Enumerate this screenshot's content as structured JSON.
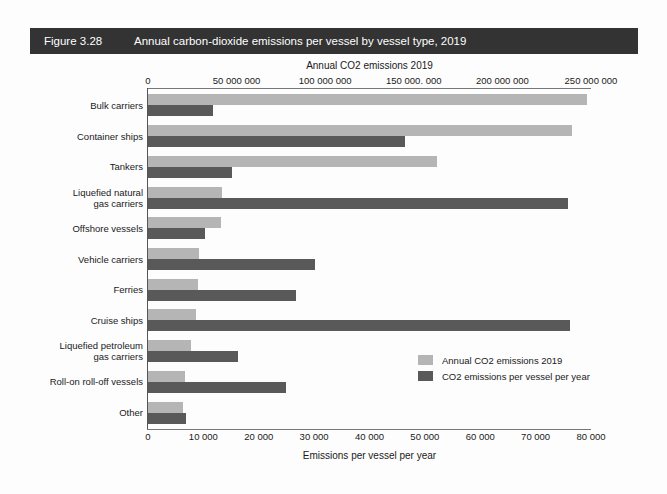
{
  "figure": {
    "number": "Figure 3.28",
    "title": "Annual carbon-dioxide emissions per vessel by vessel type, 2019"
  },
  "axes": {
    "top": {
      "title": "Annual CO2 emissions 2019",
      "ticks": [
        "0",
        "50 000 000",
        "100 000 000",
        "150 000. 000",
        "200 000 000",
        "250 000 000"
      ],
      "tick_values": [
        0,
        50000000,
        100000000,
        150000000,
        200000000,
        250000000
      ],
      "max": 250000000
    },
    "bottom": {
      "title": "Emissions per vessel per year",
      "ticks": [
        "0",
        "10 000",
        "20 000",
        "30 000",
        "40 000",
        "50 000",
        "60 000",
        "70 000",
        "80 000"
      ],
      "tick_values": [
        0,
        10000,
        20000,
        30000,
        40000,
        50000,
        60000,
        70000,
        80000
      ],
      "max": 80000
    }
  },
  "legend": {
    "position": "inside-right",
    "items": [
      {
        "label": "Annual CO2 emissions 2019",
        "color": "#b5b5b5"
      },
      {
        "label": "CO2 emissions per vessel per year",
        "color": "#595959"
      }
    ]
  },
  "colors": {
    "light_bar": "#b5b5b5",
    "dark_bar": "#595959",
    "banner": "#333333",
    "banner_text": "#ffffff",
    "text": "#1a1a1a",
    "background": "#fdfdfd"
  },
  "chart_data": {
    "type": "bar",
    "orientation": "horizontal",
    "title": "Annual carbon-dioxide emissions per vessel by vessel type, 2019",
    "xlabel": "Emissions per vessel per year",
    "xlabel_secondary": "Annual CO2 emissions 2019",
    "ylabel": "",
    "grid": false,
    "xlim": [
      0,
      80000
    ],
    "xlim_secondary": [
      0,
      250000000
    ],
    "categories": [
      "Bulk carriers",
      "Container ships",
      "Tankers",
      "Liquefied natural gas carriers",
      "Offshore vessels",
      "Vehicle carriers",
      "Ferries",
      "Cruise ships",
      "Liquefied petroleum gas carriers",
      "Roll-on roll-off vessels",
      "Other"
    ],
    "category_display": [
      [
        "Bulk carriers"
      ],
      [
        "Container ships"
      ],
      [
        "Tankers"
      ],
      [
        "Liquefied natural",
        "gas carriers"
      ],
      [
        "Offshore vessels"
      ],
      [
        "Vehicle carriers"
      ],
      [
        "Ferries"
      ],
      [
        "Cruise ships"
      ],
      [
        "Liquefied petroleum",
        "gas carriers"
      ],
      [
        "Roll-on roll-off vessels"
      ],
      [
        "Other"
      ]
    ],
    "series": [
      {
        "name": "Annual CO2 emissions 2019",
        "color": "#b5b5b5",
        "axis": "top",
        "units": "tonnes CO2",
        "values": [
          248000000,
          239000000,
          163000000,
          42000000,
          41000000,
          29000000,
          28000000,
          27000000,
          24000000,
          21000000,
          20000000
        ]
      },
      {
        "name": "CO2 emissions per vessel per year",
        "color": "#595959",
        "axis": "bottom",
        "units": "tonnes CO2 per vessel",
        "values": [
          11700,
          46400,
          15200,
          75900,
          10300,
          30100,
          26700,
          76200,
          16300,
          25000,
          6900
        ]
      }
    ]
  }
}
